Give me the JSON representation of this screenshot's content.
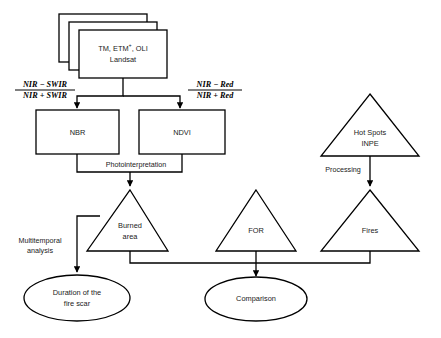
{
  "diagram": {
    "background_color": "#ffffff",
    "stroke_color": "#000000",
    "text_color": "#1a1a1a",
    "nodes": {
      "source_stack": {
        "shape": "stacked-rectangle",
        "line1": "TM, ETM",
        "superscript": "+",
        "line1_tail": ", OLI",
        "line2": "Landsat"
      },
      "nbr": {
        "shape": "rectangle",
        "label": "NBR"
      },
      "ndvi": {
        "shape": "rectangle",
        "label": "NDVI"
      },
      "hotspots": {
        "shape": "triangle",
        "line1": "Hot Spots",
        "line2": "INPE"
      },
      "burned_area": {
        "shape": "triangle",
        "line1": "Burned",
        "line2": "area"
      },
      "for": {
        "shape": "triangle",
        "label": "FOR"
      },
      "fires": {
        "shape": "triangle",
        "label": "Fires"
      },
      "duration": {
        "shape": "ellipse",
        "line1": "Duration of the",
        "line2": "fire scar"
      },
      "comparison": {
        "shape": "ellipse",
        "label": "Comparison"
      }
    },
    "formulas": {
      "nbr_formula": {
        "numerator": "NIR − SWIR",
        "denominator": "NIR + SWIR"
      },
      "ndvi_formula": {
        "numerator": "NIR − Red",
        "denominator": "NIR + Red"
      }
    },
    "edge_labels": {
      "photointerpretation": "Photointerpretation",
      "processing": "Processing",
      "multitemporal": {
        "line1": "Multitemporal",
        "line2": "analysis"
      }
    }
  }
}
